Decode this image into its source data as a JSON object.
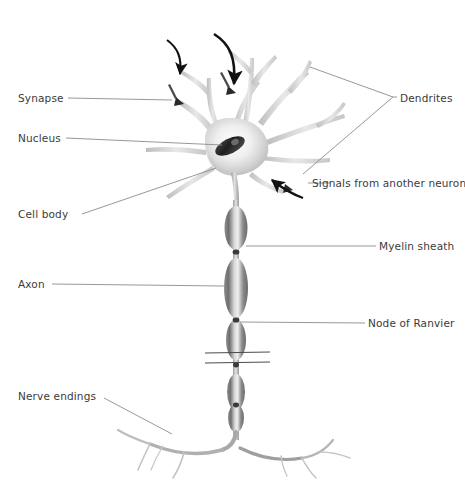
{
  "figure": {
    "style": "grayscale pencil-shaded illustration",
    "background_color": "#ffffff",
    "label_color": "#3b3b3b",
    "leader_line_color": "#8c8c8c",
    "arrow_color": "#111111",
    "cell_fill_color": "#d9d9d9",
    "nucleus_color": "#2b2b2b"
  },
  "labels": {
    "synapse": "Synapse",
    "nucleus": "Nucleus",
    "cell_body": "Cell body",
    "axon": "Axon",
    "nerve_endings": "Nerve endings",
    "dendrites": "Dendrites",
    "signals_from_another_neuron": "Signals from another neuron",
    "myelin_sheath": "Myelin sheath",
    "node_of_ranvier": "Node of Ranvier"
  },
  "label_positions": {
    "synapse": {
      "x": 18,
      "y": 92,
      "side": "left"
    },
    "nucleus": {
      "x": 18,
      "y": 132,
      "side": "left"
    },
    "cell_body": {
      "x": 18,
      "y": 212,
      "side": "left"
    },
    "axon": {
      "x": 18,
      "y": 278,
      "side": "left"
    },
    "nerve_endings": {
      "x": 18,
      "y": 390,
      "side": "left"
    },
    "dendrites": {
      "x": 398,
      "y": 93,
      "side": "right"
    },
    "signals_from_another_neuron": {
      "x": 311,
      "y": 177,
      "side": "right"
    },
    "myelin_sheath": {
      "x": 379,
      "y": 240,
      "side": "right"
    },
    "node_of_ranvier": {
      "x": 368,
      "y": 318,
      "side": "right"
    }
  },
  "parts": {
    "soma": "cell body",
    "dendrite_count": 7,
    "synaptic_boutons": 3,
    "myelin_segments": 5,
    "nodes_of_ranvier": 4,
    "axon_break_symbol": "two parallel horizontal lines",
    "incoming_signal_arrows": 3
  }
}
